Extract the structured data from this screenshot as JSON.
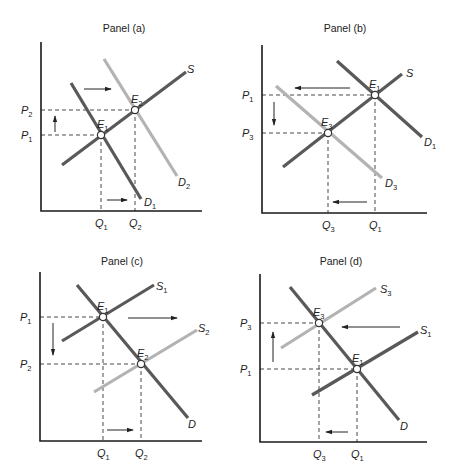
{
  "figure": {
    "colors": {
      "dark_curve": "#595959",
      "light_curve": "#b3b3b3",
      "axis": "#1a1a1a",
      "text": "#222222"
    },
    "panels": [
      {
        "id": "a",
        "title": "Panel (a)",
        "title_pos": [
          124,
          32
        ],
        "axes": {
          "origin": [
            41,
            211
          ],
          "top": 42,
          "right": 202
        },
        "curves": [
          {
            "name": "S",
            "label": "S",
            "sub": "",
            "style": "dark",
            "from": [
              62,
              165
            ],
            "to": [
              186,
              72
            ],
            "label_pos": [
              187,
              73
            ]
          },
          {
            "name": "D1",
            "label": "D",
            "sub": "1",
            "style": "dark",
            "from": [
              71,
              83
            ],
            "to": [
              141,
              199
            ],
            "label_pos": [
              144,
              206
            ]
          },
          {
            "name": "D2",
            "label": "D",
            "sub": "2",
            "style": "light",
            "from": [
              104,
              59
            ],
            "to": [
              177,
              176
            ],
            "label_pos": [
              178,
              186
            ]
          }
        ],
        "equilibria": [
          {
            "name": "E1",
            "label": "E",
            "sub": "1",
            "pt": [
              101,
              135
            ],
            "label_pos": [
              97,
              128
            ]
          },
          {
            "name": "E2",
            "label": "E",
            "sub": "2",
            "pt": [
              135,
              110
            ],
            "label_pos": [
              131,
              103
            ]
          }
        ],
        "price_labels": [
          {
            "label": "P",
            "sub": "2",
            "y": 110
          },
          {
            "label": "P",
            "sub": "1",
            "y": 135
          }
        ],
        "quantity_labels": [
          {
            "label": "Q",
            "sub": "1",
            "x": 101
          },
          {
            "label": "Q",
            "sub": "2",
            "x": 135
          }
        ],
        "arrows": [
          {
            "name": "demand-shift-arrow",
            "from": [
              84,
              89
            ],
            "to": [
              111,
              89
            ]
          },
          {
            "name": "price-change-arrow",
            "from": [
              55,
              132
            ],
            "to": [
              55,
              116
            ]
          },
          {
            "name": "quantity-change-arrow",
            "from": [
              107,
              200
            ],
            "to": [
              127,
              200
            ]
          }
        ]
      },
      {
        "id": "b",
        "title": "Panel (b)",
        "title_pos": [
          345,
          32
        ],
        "axes": {
          "origin": [
            262,
            213
          ],
          "top": 45,
          "right": 427
        },
        "curves": [
          {
            "name": "S",
            "label": "S",
            "sub": "",
            "style": "dark",
            "from": [
              283,
              167
            ],
            "to": [
              402,
              74
            ],
            "label_pos": [
              406,
              77
            ]
          },
          {
            "name": "D1",
            "label": "D",
            "sub": "1",
            "style": "dark",
            "from": [
              337,
              61
            ],
            "to": [
              422,
              137
            ],
            "label_pos": [
              424,
              146
            ]
          },
          {
            "name": "D3",
            "label": "D",
            "sub": "3",
            "style": "light",
            "from": [
              276,
              86
            ],
            "to": [
              382,
              178
            ],
            "label_pos": [
              385,
              187
            ]
          }
        ],
        "equilibria": [
          {
            "name": "E1",
            "label": "E",
            "sub": "1",
            "pt": [
              375,
              95
            ],
            "label_pos": [
              369,
              88
            ]
          },
          {
            "name": "E3",
            "label": "E",
            "sub": "3",
            "pt": [
              328,
              133
            ],
            "label_pos": [
              321,
              126
            ]
          }
        ],
        "price_labels": [
          {
            "label": "P",
            "sub": "1",
            "y": 95
          },
          {
            "label": "P",
            "sub": "3",
            "y": 133
          }
        ],
        "quantity_labels": [
          {
            "label": "Q",
            "sub": "3",
            "x": 328
          },
          {
            "label": "Q",
            "sub": "1",
            "x": 375
          }
        ],
        "arrows": [
          {
            "name": "demand-shift-arrow",
            "from": [
              350,
              88
            ],
            "to": [
              295,
              88
            ]
          },
          {
            "name": "price-change-arrow",
            "from": [
              274,
              102
            ],
            "to": [
              274,
              125
            ]
          },
          {
            "name": "quantity-change-arrow",
            "from": [
              367,
              202
            ],
            "to": [
              333,
              202
            ]
          }
        ]
      },
      {
        "id": "c",
        "title": "Panel (c)",
        "title_pos": [
          122,
          265
        ],
        "axes": {
          "origin": [
            40,
            441
          ],
          "top": 272,
          "right": 202
        },
        "curves": [
          {
            "name": "S1",
            "label": "S",
            "sub": "1",
            "style": "dark",
            "from": [
              62,
              341
            ],
            "to": [
              154,
              285
            ],
            "label_pos": [
              156,
              290
            ]
          },
          {
            "name": "S2",
            "label": "S",
            "sub": "2",
            "style": "light",
            "from": [
              94,
              392
            ],
            "to": [
              197,
              330
            ],
            "label_pos": [
              198,
              332
            ]
          },
          {
            "name": "D",
            "label": "D",
            "sub": "",
            "style": "dark",
            "from": [
              77,
              285
            ],
            "to": [
              188,
              418
            ],
            "label_pos": [
              188,
              428
            ]
          }
        ],
        "equilibria": [
          {
            "name": "E1",
            "label": "E",
            "sub": "1",
            "pt": [
              103,
              317
            ],
            "label_pos": [
              97,
              310
            ]
          },
          {
            "name": "E2",
            "label": "E",
            "sub": "2",
            "pt": [
              141,
              364
            ],
            "label_pos": [
              137,
              357
            ]
          }
        ],
        "price_labels": [
          {
            "label": "P",
            "sub": "1",
            "y": 317
          },
          {
            "label": "P",
            "sub": "2",
            "y": 364
          }
        ],
        "quantity_labels": [
          {
            "label": "Q",
            "sub": "1",
            "x": 103
          },
          {
            "label": "Q",
            "sub": "2",
            "x": 141
          }
        ],
        "arrows": [
          {
            "name": "supply-shift-arrow",
            "from": [
              128,
              318
            ],
            "to": [
              177,
              318
            ]
          },
          {
            "name": "price-change-arrow",
            "from": [
              53,
              323
            ],
            "to": [
              53,
              355
            ]
          },
          {
            "name": "quantity-change-arrow",
            "from": [
              107,
              430
            ],
            "to": [
              133,
              430
            ]
          }
        ]
      },
      {
        "id": "d",
        "title": "Panel (d)",
        "title_pos": [
          341,
          265
        ],
        "axes": {
          "origin": [
            260,
            442
          ],
          "top": 274,
          "right": 427
        },
        "curves": [
          {
            "name": "S3",
            "label": "S",
            "sub": "3",
            "style": "light",
            "from": [
              281,
              348
            ],
            "to": [
              376,
              288
            ],
            "label_pos": [
              380,
              293
            ]
          },
          {
            "name": "S1",
            "label": "S",
            "sub": "1",
            "style": "dark",
            "from": [
              312,
              395
            ],
            "to": [
              418,
              332
            ],
            "label_pos": [
              420,
              334
            ]
          },
          {
            "name": "D",
            "label": "D",
            "sub": "",
            "style": "dark",
            "from": [
              290,
              287
            ],
            "to": [
              399,
              420
            ],
            "label_pos": [
              400,
              430
            ]
          }
        ],
        "equilibria": [
          {
            "name": "E3",
            "label": "E",
            "sub": "3",
            "pt": [
              319,
              323
            ],
            "label_pos": [
              313,
              316
            ]
          },
          {
            "name": "E1",
            "label": "E",
            "sub": "1",
            "pt": [
              357,
              369
            ],
            "label_pos": [
              352,
              362
            ]
          }
        ],
        "price_labels": [
          {
            "label": "P",
            "sub": "3",
            "y": 323
          },
          {
            "label": "P",
            "sub": "1",
            "y": 369
          }
        ],
        "quantity_labels": [
          {
            "label": "Q",
            "sub": "3",
            "x": 319
          },
          {
            "label": "Q",
            "sub": "1",
            "x": 357
          }
        ],
        "arrows": [
          {
            "name": "supply-shift-arrow",
            "from": [
              400,
              327
            ],
            "to": [
              342,
              327
            ]
          },
          {
            "name": "price-change-arrow",
            "from": [
              273,
              362
            ],
            "to": [
              273,
              332
            ]
          },
          {
            "name": "quantity-change-arrow",
            "from": [
              348,
              432
            ],
            "to": [
              326,
              432
            ]
          }
        ]
      }
    ]
  }
}
